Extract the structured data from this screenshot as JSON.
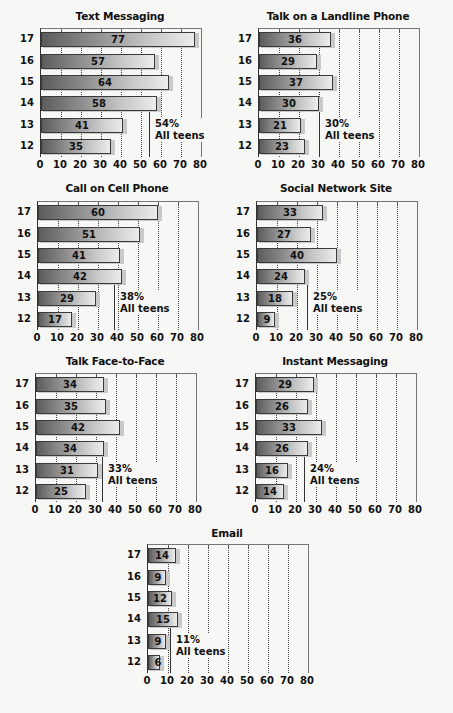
{
  "chart_data": [
    {
      "type": "bar",
      "orientation": "horizontal",
      "title": "Text Messaging",
      "categories": [
        "17",
        "16",
        "15",
        "14",
        "13",
        "12"
      ],
      "values": [
        77,
        57,
        64,
        58,
        41,
        35
      ],
      "average": {
        "value": 54,
        "label_pct": "54%",
        "label_text": "All teens"
      },
      "xlabel": "",
      "ylabel": "",
      "xlim": [
        0,
        80
      ],
      "xticks": [
        "0",
        "10",
        "20",
        "30",
        "40",
        "50",
        "60",
        "70",
        "80"
      ],
      "grid": "dotted vertical"
    },
    {
      "type": "bar",
      "orientation": "horizontal",
      "title": "Talk on a Landline Phone",
      "categories": [
        "17",
        "16",
        "15",
        "14",
        "13",
        "12"
      ],
      "values": [
        36,
        29,
        37,
        30,
        21,
        23
      ],
      "average": {
        "value": 30,
        "label_pct": "30%",
        "label_text": "All teens"
      },
      "xlabel": "",
      "ylabel": "",
      "xlim": [
        0,
        80
      ],
      "xticks": [
        "0",
        "10",
        "20",
        "30",
        "40",
        "50",
        "60",
        "70",
        "80"
      ],
      "grid": "dotted vertical"
    },
    {
      "type": "bar",
      "orientation": "horizontal",
      "title": "Call on Cell Phone",
      "categories": [
        "17",
        "16",
        "15",
        "14",
        "13",
        "12"
      ],
      "values": [
        60,
        51,
        41,
        42,
        29,
        17
      ],
      "average": {
        "value": 38,
        "label_pct": "38%",
        "label_text": "All teens"
      },
      "xlabel": "",
      "ylabel": "",
      "xlim": [
        0,
        80
      ],
      "xticks": [
        "0",
        "10",
        "20",
        "30",
        "40",
        "50",
        "60",
        "70",
        "80"
      ],
      "grid": "dotted vertical"
    },
    {
      "type": "bar",
      "orientation": "horizontal",
      "title": "Social Network Site",
      "categories": [
        "17",
        "16",
        "15",
        "14",
        "13",
        "12"
      ],
      "values": [
        33,
        27,
        40,
        24,
        18,
        9
      ],
      "average": {
        "value": 25,
        "label_pct": "25%",
        "label_text": "All teens"
      },
      "xlabel": "",
      "ylabel": "",
      "xlim": [
        0,
        80
      ],
      "xticks": [
        "0",
        "10",
        "20",
        "30",
        "40",
        "50",
        "60",
        "70",
        "80"
      ],
      "grid": "dotted vertical"
    },
    {
      "type": "bar",
      "orientation": "horizontal",
      "title": "Talk Face-to-Face",
      "categories": [
        "17",
        "16",
        "15",
        "14",
        "13",
        "12"
      ],
      "values": [
        34,
        35,
        42,
        34,
        31,
        25
      ],
      "average": {
        "value": 33,
        "label_pct": "33%",
        "label_text": "All teens"
      },
      "xlabel": "",
      "ylabel": "",
      "xlim": [
        0,
        80
      ],
      "xticks": [
        "0",
        "10",
        "20",
        "30",
        "40",
        "50",
        "60",
        "70",
        "80"
      ],
      "grid": "dotted vertical"
    },
    {
      "type": "bar",
      "orientation": "horizontal",
      "title": "Instant Messaging",
      "categories": [
        "17",
        "16",
        "15",
        "14",
        "13",
        "12"
      ],
      "values": [
        29,
        26,
        33,
        26,
        16,
        14
      ],
      "average": {
        "value": 24,
        "label_pct": "24%",
        "label_text": "All teens"
      },
      "xlabel": "",
      "ylabel": "",
      "xlim": [
        0,
        80
      ],
      "xticks": [
        "0",
        "10",
        "20",
        "30",
        "40",
        "50",
        "60",
        "70",
        "80"
      ],
      "grid": "dotted vertical"
    },
    {
      "type": "bar",
      "orientation": "horizontal",
      "title": "Email",
      "categories": [
        "17",
        "16",
        "15",
        "14",
        "13",
        "12"
      ],
      "values": [
        14,
        9,
        12,
        15,
        9,
        6
      ],
      "average": {
        "value": 11,
        "label_pct": "11%",
        "label_text": "All teens"
      },
      "xlabel": "",
      "ylabel": "",
      "xlim": [
        0,
        80
      ],
      "xticks": [
        "0",
        "10",
        "20",
        "30",
        "40",
        "50",
        "60",
        "70",
        "80"
      ],
      "grid": "dotted vertical"
    }
  ],
  "layout": {
    "panels": [
      {
        "left": 20,
        "top": 10,
        "plot_left": 40,
        "plot_top": 28,
        "plot_width": 160,
        "plot_height": 128,
        "title_width": 200
      },
      {
        "left": 238,
        "top": 10,
        "plot_left": 258,
        "plot_top": 28,
        "plot_width": 160,
        "plot_height": 128,
        "title_width": 200
      },
      {
        "left": 17,
        "top": 182,
        "plot_left": 37,
        "plot_top": 201,
        "plot_width": 160,
        "plot_height": 128,
        "title_width": 200
      },
      {
        "left": 236,
        "top": 182,
        "plot_left": 256,
        "plot_top": 201,
        "plot_width": 160,
        "plot_height": 128,
        "title_width": 200
      },
      {
        "left": 15,
        "top": 355,
        "plot_left": 35,
        "plot_top": 373,
        "plot_width": 160,
        "plot_height": 128,
        "title_width": 200
      },
      {
        "left": 235,
        "top": 355,
        "plot_left": 255,
        "plot_top": 373,
        "plot_width": 160,
        "plot_height": 128,
        "title_width": 200
      },
      {
        "left": 127,
        "top": 527,
        "plot_left": 147,
        "plot_top": 544,
        "plot_width": 160,
        "plot_height": 128,
        "title_width": 200
      }
    ],
    "avg_label_offsets": [
      {
        "dx": 6,
        "dy": 90
      },
      {
        "dx": 6,
        "dy": 90
      },
      {
        "dx": 6,
        "dy": 90
      },
      {
        "dx": 6,
        "dy": 90
      },
      {
        "dx": 6,
        "dy": 90
      },
      {
        "dx": 6,
        "dy": 90
      },
      {
        "dx": 6,
        "dy": 90
      }
    ]
  }
}
